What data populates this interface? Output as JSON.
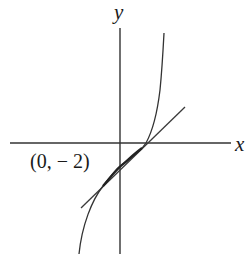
{
  "diagram": {
    "type": "function graph with tangent line",
    "axes": {
      "x_label": "x",
      "y_label": "y"
    },
    "annotations": [
      {
        "text": "(0, − 2)",
        "refers_to": "y-intercept of tangent line / point of tangency"
      }
    ],
    "elements": [
      {
        "kind": "curve",
        "description": "increasing cubic-like curve passing through (0, -2) with inflection there"
      },
      {
        "kind": "line",
        "description": "tangent line at (0, -2)"
      },
      {
        "kind": "axis",
        "name": "x-axis"
      },
      {
        "kind": "axis",
        "name": "y-axis"
      }
    ],
    "colors": {
      "stroke": "#333333",
      "background": "#ffffff"
    }
  }
}
